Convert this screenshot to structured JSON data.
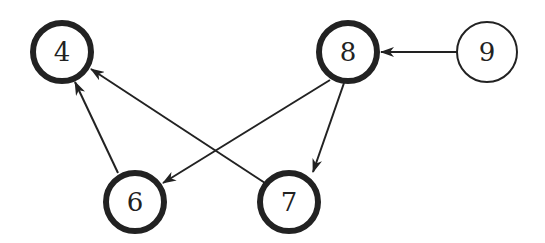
{
  "diagram": {
    "type": "directed-graph",
    "nodes": [
      {
        "id": "4",
        "label": "4",
        "x": 62,
        "y": 52,
        "bold": true
      },
      {
        "id": "8",
        "label": "8",
        "x": 348,
        "y": 52,
        "bold": true
      },
      {
        "id": "9",
        "label": "9",
        "x": 487,
        "y": 52,
        "bold": false
      },
      {
        "id": "6",
        "label": "6",
        "x": 135,
        "y": 202,
        "bold": true
      },
      {
        "id": "7",
        "label": "7",
        "x": 289,
        "y": 202,
        "bold": true
      }
    ],
    "edges": [
      {
        "from": "9",
        "to": "8"
      },
      {
        "from": "6",
        "to": "4"
      },
      {
        "from": "7",
        "to": "4"
      },
      {
        "from": "8",
        "to": "6"
      },
      {
        "from": "8",
        "to": "7"
      }
    ],
    "colors": {
      "stroke": "#222222",
      "background": "#ffffff"
    }
  }
}
